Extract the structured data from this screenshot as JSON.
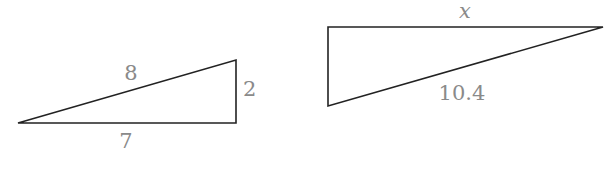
{
  "diagram": {
    "triangles": [
      {
        "name": "left-triangle",
        "vertices": [
          [
            18,
            123
          ],
          [
            236,
            60
          ],
          [
            236,
            123
          ]
        ],
        "labels": {
          "hypotenuse": "8",
          "vertical": "2",
          "base": "7"
        }
      },
      {
        "name": "right-triangle",
        "vertices": [
          [
            328,
            27
          ],
          [
            603,
            27
          ],
          [
            328,
            106
          ]
        ],
        "labels": {
          "top": "x",
          "hypotenuse": "10.4"
        }
      }
    ],
    "colors": {
      "line": "#222222",
      "label": "#8a8a8a",
      "background": "#ffffff"
    }
  }
}
